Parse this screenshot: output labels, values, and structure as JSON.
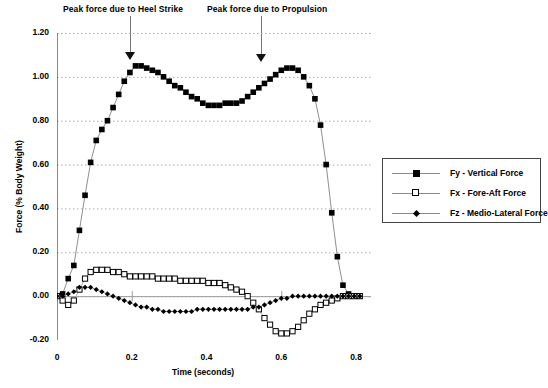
{
  "chart_data": {
    "type": "line",
    "title": "",
    "xlabel": "Time (seconds)",
    "ylabel": "Force (% Body Weight)",
    "xlim": [
      0,
      0.84
    ],
    "ylim": [
      -0.2,
      1.2
    ],
    "xticks": [
      0,
      0.2,
      0.4,
      0.6,
      0.8
    ],
    "xtick_labels": [
      "0",
      "0.2",
      "0.4",
      "0.6",
      "0.8"
    ],
    "yticks": [
      -0.2,
      0.0,
      0.2,
      0.4,
      0.6,
      0.8,
      1.0,
      1.2
    ],
    "ytick_labels": [
      "-0.20",
      "0.00",
      "0.20",
      "0.40",
      "0.60",
      "0.80",
      "1.00",
      "1.20"
    ],
    "grid": "horizontal-dotted",
    "legend_position": "right-outside",
    "series": [
      {
        "name": "Fy - Vertical Force",
        "marker": "filled-square",
        "color": "#000000",
        "x": [
          0.0,
          0.015,
          0.03,
          0.045,
          0.06,
          0.075,
          0.09,
          0.105,
          0.12,
          0.135,
          0.15,
          0.165,
          0.18,
          0.195,
          0.21,
          0.225,
          0.24,
          0.255,
          0.27,
          0.285,
          0.3,
          0.315,
          0.33,
          0.345,
          0.36,
          0.375,
          0.39,
          0.405,
          0.42,
          0.435,
          0.45,
          0.465,
          0.48,
          0.495,
          0.51,
          0.525,
          0.54,
          0.555,
          0.57,
          0.585,
          0.6,
          0.615,
          0.63,
          0.645,
          0.66,
          0.675,
          0.69,
          0.705,
          0.72,
          0.735,
          0.75,
          0.765,
          0.78,
          0.795,
          0.81
        ],
        "y": [
          0.0,
          0.01,
          0.08,
          0.14,
          0.3,
          0.46,
          0.61,
          0.71,
          0.76,
          0.8,
          0.86,
          0.92,
          0.98,
          1.02,
          1.05,
          1.05,
          1.04,
          1.03,
          1.02,
          1.0,
          0.98,
          0.96,
          0.95,
          0.93,
          0.91,
          0.9,
          0.88,
          0.87,
          0.87,
          0.87,
          0.88,
          0.88,
          0.88,
          0.89,
          0.91,
          0.93,
          0.95,
          0.97,
          0.99,
          1.01,
          1.03,
          1.04,
          1.04,
          1.03,
          1.0,
          0.96,
          0.9,
          0.78,
          0.6,
          0.38,
          0.18,
          0.05,
          0.01,
          0.0,
          0.0
        ]
      },
      {
        "name": "Fx - Fore-Aft Force",
        "marker": "open-square",
        "color": "#000000",
        "x": [
          0.0,
          0.015,
          0.03,
          0.045,
          0.06,
          0.075,
          0.09,
          0.105,
          0.12,
          0.135,
          0.15,
          0.165,
          0.18,
          0.195,
          0.21,
          0.225,
          0.24,
          0.255,
          0.27,
          0.285,
          0.3,
          0.315,
          0.33,
          0.345,
          0.36,
          0.375,
          0.39,
          0.405,
          0.42,
          0.435,
          0.45,
          0.465,
          0.48,
          0.495,
          0.51,
          0.525,
          0.54,
          0.555,
          0.57,
          0.585,
          0.6,
          0.615,
          0.63,
          0.645,
          0.66,
          0.675,
          0.69,
          0.705,
          0.72,
          0.735,
          0.75,
          0.765,
          0.78,
          0.795,
          0.81
        ],
        "y": [
          0.0,
          -0.02,
          -0.04,
          -0.02,
          0.03,
          0.08,
          0.11,
          0.12,
          0.12,
          0.12,
          0.11,
          0.11,
          0.1,
          0.09,
          0.09,
          0.09,
          0.09,
          0.09,
          0.08,
          0.08,
          0.08,
          0.08,
          0.07,
          0.07,
          0.07,
          0.07,
          0.07,
          0.06,
          0.06,
          0.06,
          0.05,
          0.04,
          0.03,
          0.02,
          0.0,
          -0.03,
          -0.06,
          -0.1,
          -0.13,
          -0.16,
          -0.17,
          -0.17,
          -0.16,
          -0.14,
          -0.11,
          -0.08,
          -0.06,
          -0.04,
          -0.03,
          -0.02,
          -0.01,
          0.0,
          0.0,
          0.0,
          0.0
        ]
      },
      {
        "name": "Fz - Medio-Lateral Force",
        "marker": "filled-diamond",
        "color": "#000000",
        "x": [
          0.0,
          0.015,
          0.03,
          0.045,
          0.06,
          0.075,
          0.09,
          0.105,
          0.12,
          0.135,
          0.15,
          0.165,
          0.18,
          0.195,
          0.21,
          0.225,
          0.24,
          0.255,
          0.27,
          0.285,
          0.3,
          0.315,
          0.33,
          0.345,
          0.36,
          0.375,
          0.39,
          0.405,
          0.42,
          0.435,
          0.45,
          0.465,
          0.48,
          0.495,
          0.51,
          0.525,
          0.54,
          0.555,
          0.57,
          0.585,
          0.6,
          0.615,
          0.63,
          0.645,
          0.66,
          0.675,
          0.69,
          0.705,
          0.72,
          0.735,
          0.75,
          0.765,
          0.78,
          0.795,
          0.81
        ],
        "y": [
          0.0,
          0.0,
          0.01,
          0.02,
          0.04,
          0.04,
          0.04,
          0.03,
          0.02,
          0.01,
          0.0,
          -0.01,
          -0.02,
          -0.03,
          -0.04,
          -0.05,
          -0.05,
          -0.06,
          -0.06,
          -0.07,
          -0.07,
          -0.07,
          -0.07,
          -0.07,
          -0.07,
          -0.06,
          -0.06,
          -0.06,
          -0.06,
          -0.06,
          -0.06,
          -0.06,
          -0.06,
          -0.06,
          -0.06,
          -0.05,
          -0.05,
          -0.04,
          -0.03,
          -0.02,
          -0.01,
          -0.01,
          0.0,
          0.0,
          0.0,
          0.0,
          0.0,
          0.0,
          0.0,
          0.0,
          0.0,
          0.0,
          0.0,
          0.0,
          0.0
        ]
      }
    ],
    "annotations": [
      {
        "text": "Peak force due to Heel Strike",
        "x": 0.195,
        "y": 1.05
      },
      {
        "text": "Peak force due to Propulsion",
        "x": 0.545,
        "y": 1.04
      }
    ]
  },
  "legend": {
    "items": [
      {
        "label": "Fy - Vertical Force",
        "marker": "filled-square"
      },
      {
        "label": "Fx - Fore-Aft Force",
        "marker": "open-square"
      },
      {
        "label": "Fz - Medio-Lateral Force",
        "marker": "filled-diamond"
      }
    ]
  }
}
